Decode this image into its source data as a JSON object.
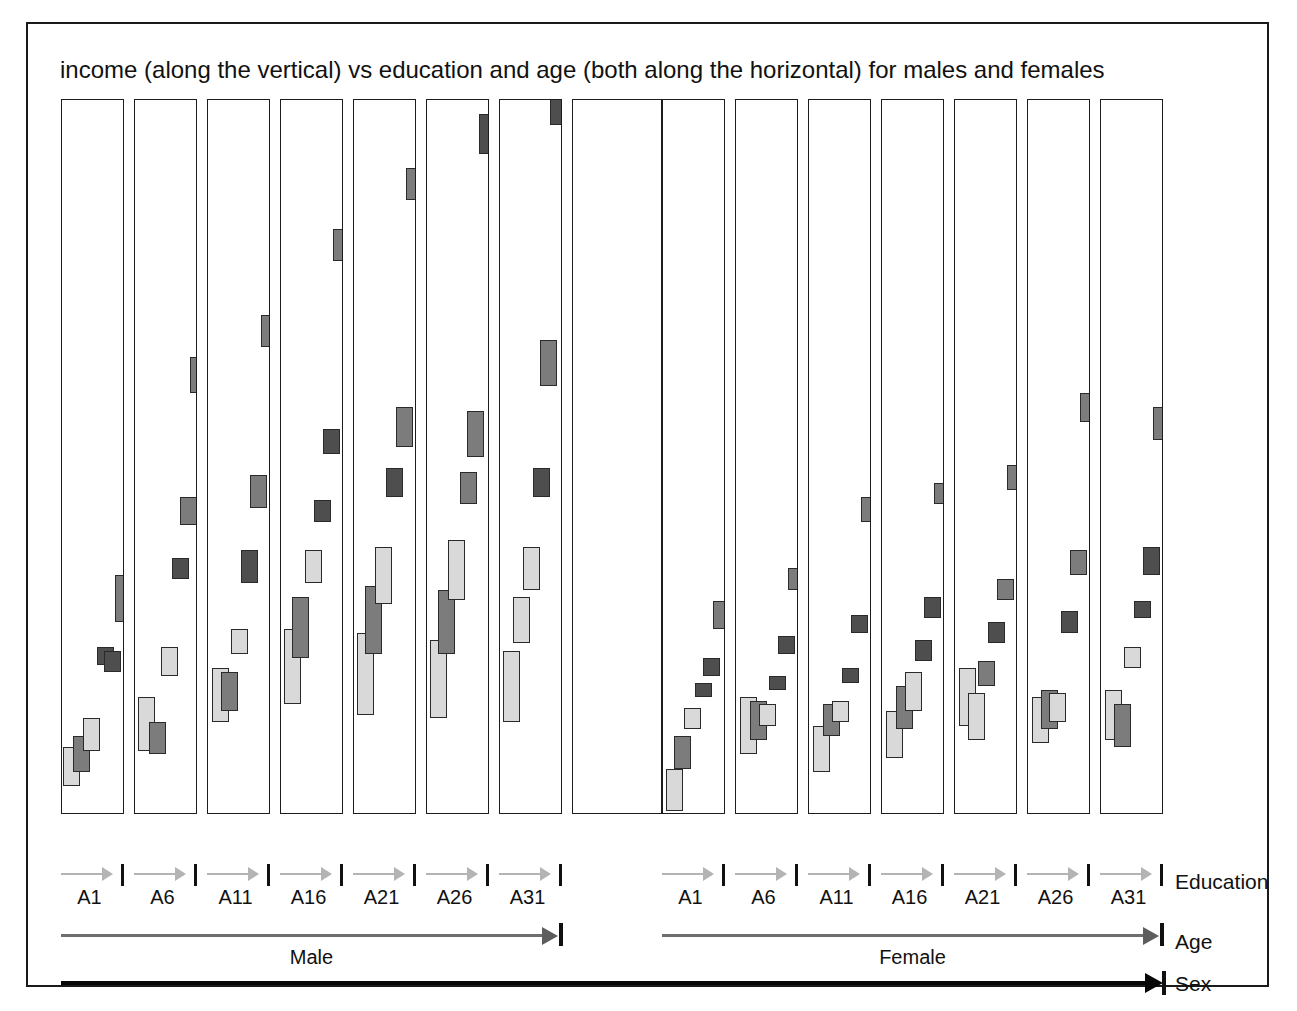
{
  "figure": {
    "title": "income (along the vertical) vs education and age (both along the horizontal) for males and females",
    "axis_names": {
      "education": "Education",
      "age": "Age",
      "sex": "Sex"
    },
    "sex_levels": [
      "Male",
      "Female"
    ],
    "age_levels": [
      "A1",
      "A6",
      "A11",
      "A16",
      "A21",
      "A26",
      "A31"
    ],
    "colors": {
      "light_mark": "#d9d9d9",
      "dark_mark": "#7c7c7c",
      "darker_mark": "#4e4e4e",
      "mark_outline": "#2a2a2a",
      "panel_border": "#1c1c1c",
      "education_arrow": "#b4b4b4",
      "age_arrow": "#6e6e6e",
      "sex_arrow": "#070707",
      "figure_border": "#1a1a1a",
      "background": "#ffffff"
    }
  },
  "chart_data": {
    "type": "bar",
    "title": "income (along the vertical) vs education and age (both along the horizontal) for males and females",
    "xlabel": "education and age (both along the horizontal)",
    "ylabel": "income (along the vertical)",
    "grid": false,
    "legend_position": "none",
    "nesting": [
      "Sex",
      "Age",
      "Education"
    ],
    "categories": [
      "A1",
      "A6",
      "A11",
      "A16",
      "A21",
      "A26",
      "A31"
    ],
    "ylim": [
      0,
      100
    ],
    "panels": [
      {
        "sex": "Male",
        "age": "A1",
        "panel_index": 0,
        "marks": [
          {
            "education": 1,
            "x_frac": 0.02,
            "value_low": 4.0,
            "value_high": 9.5,
            "shade": "light"
          },
          {
            "education": 2,
            "x_frac": 0.18,
            "value_low": 6.0,
            "value_high": 11.0,
            "shade": "dark"
          },
          {
            "education": 3,
            "x_frac": 0.34,
            "value_low": 9.0,
            "value_high": 13.5,
            "shade": "light"
          },
          {
            "education": 4,
            "x_frac": 0.56,
            "value_low": 21.0,
            "value_high": 23.5,
            "shade": "darker"
          },
          {
            "education": 5,
            "x_frac": 0.66,
            "value_low": 20.0,
            "value_high": 23.0,
            "shade": "darker"
          },
          {
            "education": 6,
            "x_frac": 0.84,
            "value_low": 27.0,
            "value_high": 33.5,
            "shade": "dark"
          }
        ]
      },
      {
        "sex": "Male",
        "age": "A6",
        "panel_index": 1,
        "marks": [
          {
            "education": 1,
            "x_frac": 0.05,
            "value_low": 9.0,
            "value_high": 16.5,
            "shade": "light"
          },
          {
            "education": 2,
            "x_frac": 0.22,
            "value_low": 8.5,
            "value_high": 13.0,
            "shade": "dark"
          },
          {
            "education": 3,
            "x_frac": 0.42,
            "value_low": 19.5,
            "value_high": 23.5,
            "shade": "light"
          },
          {
            "education": 4,
            "x_frac": 0.58,
            "value_low": 33.0,
            "value_high": 36.0,
            "shade": "darker"
          },
          {
            "education": 5,
            "x_frac": 0.72,
            "value_low": 40.5,
            "value_high": 44.5,
            "shade": "dark"
          },
          {
            "education": 6,
            "x_frac": 0.88,
            "value_low": 59.0,
            "value_high": 64.0,
            "shade": "dark"
          }
        ]
      },
      {
        "sex": "Male",
        "age": "A11",
        "panel_index": 2,
        "marks": [
          {
            "education": 1,
            "x_frac": 0.06,
            "value_low": 13.0,
            "value_high": 20.5,
            "shade": "light"
          },
          {
            "education": 2,
            "x_frac": 0.2,
            "value_low": 14.5,
            "value_high": 20.0,
            "shade": "dark"
          },
          {
            "education": 3,
            "x_frac": 0.36,
            "value_low": 22.5,
            "value_high": 26.0,
            "shade": "light"
          },
          {
            "education": 4,
            "x_frac": 0.52,
            "value_low": 32.5,
            "value_high": 37.0,
            "shade": "darker"
          },
          {
            "education": 5,
            "x_frac": 0.66,
            "value_low": 43.0,
            "value_high": 47.5,
            "shade": "dark"
          },
          {
            "education": 6,
            "x_frac": 0.84,
            "value_low": 65.5,
            "value_high": 70.0,
            "shade": "dark"
          }
        ]
      },
      {
        "sex": "Male",
        "age": "A16",
        "panel_index": 3,
        "marks": [
          {
            "education": 1,
            "x_frac": 0.04,
            "value_low": 15.5,
            "value_high": 26.0,
            "shade": "light"
          },
          {
            "education": 2,
            "x_frac": 0.18,
            "value_low": 22.0,
            "value_high": 30.5,
            "shade": "dark"
          },
          {
            "education": 3,
            "x_frac": 0.38,
            "value_low": 32.5,
            "value_high": 37.0,
            "shade": "light"
          },
          {
            "education": 4,
            "x_frac": 0.52,
            "value_low": 41.0,
            "value_high": 44.0,
            "shade": "darker"
          },
          {
            "education": 5,
            "x_frac": 0.66,
            "value_low": 50.5,
            "value_high": 54.0,
            "shade": "darker"
          },
          {
            "education": 6,
            "x_frac": 0.82,
            "value_low": 77.5,
            "value_high": 82.0,
            "shade": "dark"
          }
        ]
      },
      {
        "sex": "Male",
        "age": "A21",
        "panel_index": 4,
        "marks": [
          {
            "education": 1,
            "x_frac": 0.04,
            "value_low": 14.0,
            "value_high": 25.5,
            "shade": "light"
          },
          {
            "education": 2,
            "x_frac": 0.18,
            "value_low": 22.5,
            "value_high": 32.0,
            "shade": "dark"
          },
          {
            "education": 3,
            "x_frac": 0.34,
            "value_low": 29.5,
            "value_high": 37.5,
            "shade": "light"
          },
          {
            "education": 4,
            "x_frac": 0.5,
            "value_low": 44.5,
            "value_high": 48.5,
            "shade": "darker"
          },
          {
            "education": 5,
            "x_frac": 0.66,
            "value_low": 51.5,
            "value_high": 57.0,
            "shade": "dark"
          },
          {
            "education": 6,
            "x_frac": 0.82,
            "value_low": 86.0,
            "value_high": 90.5,
            "shade": "dark"
          }
        ]
      },
      {
        "sex": "Male",
        "age": "A26",
        "panel_index": 5,
        "marks": [
          {
            "education": 1,
            "x_frac": 0.04,
            "value_low": 13.5,
            "value_high": 24.5,
            "shade": "light"
          },
          {
            "education": 2,
            "x_frac": 0.18,
            "value_low": 22.5,
            "value_high": 31.5,
            "shade": "dark"
          },
          {
            "education": 3,
            "x_frac": 0.34,
            "value_low": 30.0,
            "value_high": 38.5,
            "shade": "light"
          },
          {
            "education": 4,
            "x_frac": 0.52,
            "value_low": 43.5,
            "value_high": 48.0,
            "shade": "dark"
          },
          {
            "education": 5,
            "x_frac": 0.64,
            "value_low": 50.0,
            "value_high": 56.5,
            "shade": "dark"
          },
          {
            "education": 6,
            "x_frac": 0.82,
            "value_low": 92.5,
            "value_high": 98.0,
            "shade": "darker"
          }
        ]
      },
      {
        "sex": "Male",
        "age": "A31",
        "panel_index": 6,
        "marks": [
          {
            "education": 1,
            "x_frac": 0.04,
            "value_low": 13.0,
            "value_high": 23.0,
            "shade": "light"
          },
          {
            "education": 2,
            "x_frac": 0.2,
            "value_low": 24.0,
            "value_high": 30.5,
            "shade": "light"
          },
          {
            "education": 3,
            "x_frac": 0.36,
            "value_low": 31.5,
            "value_high": 37.5,
            "shade": "light"
          },
          {
            "education": 4,
            "x_frac": 0.52,
            "value_low": 44.5,
            "value_high": 48.5,
            "shade": "darker"
          },
          {
            "education": 5,
            "x_frac": 0.64,
            "value_low": 60.0,
            "value_high": 66.5,
            "shade": "dark"
          },
          {
            "education": 6,
            "x_frac": 0.8,
            "value_low": 96.5,
            "value_high": 101.0,
            "shade": "darker"
          }
        ]
      },
      {
        "sex": "Female",
        "age": "A1",
        "panel_index": 7,
        "marks": [
          {
            "education": 1,
            "x_frac": 0.04,
            "value_low": 0.5,
            "value_high": 6.5,
            "shade": "light"
          },
          {
            "education": 2,
            "x_frac": 0.18,
            "value_low": 6.5,
            "value_high": 11.0,
            "shade": "dark"
          },
          {
            "education": 3,
            "x_frac": 0.34,
            "value_low": 12.0,
            "value_high": 15.0,
            "shade": "light"
          },
          {
            "education": 4,
            "x_frac": 0.5,
            "value_low": 16.5,
            "value_high": 18.5,
            "shade": "darker"
          },
          {
            "education": 5,
            "x_frac": 0.64,
            "value_low": 19.5,
            "value_high": 22.0,
            "shade": "darker"
          },
          {
            "education": 6,
            "x_frac": 0.8,
            "value_low": 26.0,
            "value_high": 30.0,
            "shade": "dark"
          }
        ]
      },
      {
        "sex": "Female",
        "age": "A6",
        "panel_index": 8,
        "marks": [
          {
            "education": 1,
            "x_frac": 0.06,
            "value_low": 8.5,
            "value_high": 16.5,
            "shade": "light"
          },
          {
            "education": 2,
            "x_frac": 0.22,
            "value_low": 10.5,
            "value_high": 16.0,
            "shade": "dark"
          },
          {
            "education": 3,
            "x_frac": 0.36,
            "value_low": 12.5,
            "value_high": 15.5,
            "shade": "light"
          },
          {
            "education": 4,
            "x_frac": 0.52,
            "value_low": 17.5,
            "value_high": 19.5,
            "shade": "darker"
          },
          {
            "education": 5,
            "x_frac": 0.66,
            "value_low": 22.5,
            "value_high": 25.0,
            "shade": "darker"
          },
          {
            "education": 6,
            "x_frac": 0.82,
            "value_low": 31.5,
            "value_high": 34.5,
            "shade": "dark"
          }
        ]
      },
      {
        "sex": "Female",
        "age": "A11",
        "panel_index": 9,
        "marks": [
          {
            "education": 1,
            "x_frac": 0.06,
            "value_low": 6.0,
            "value_high": 12.5,
            "shade": "light"
          },
          {
            "education": 2,
            "x_frac": 0.22,
            "value_low": 11.0,
            "value_high": 15.5,
            "shade": "dark"
          },
          {
            "education": 3,
            "x_frac": 0.36,
            "value_low": 13.0,
            "value_high": 16.0,
            "shade": "light"
          },
          {
            "education": 4,
            "x_frac": 0.52,
            "value_low": 18.5,
            "value_high": 20.5,
            "shade": "darker"
          },
          {
            "education": 5,
            "x_frac": 0.66,
            "value_low": 25.5,
            "value_high": 28.0,
            "shade": "darker"
          },
          {
            "education": 6,
            "x_frac": 0.82,
            "value_low": 41.0,
            "value_high": 44.5,
            "shade": "dark"
          }
        ]
      },
      {
        "sex": "Female",
        "age": "A16",
        "panel_index": 10,
        "marks": [
          {
            "education": 1,
            "x_frac": 0.06,
            "value_low": 8.0,
            "value_high": 14.5,
            "shade": "light"
          },
          {
            "education": 2,
            "x_frac": 0.22,
            "value_low": 12.0,
            "value_high": 18.0,
            "shade": "dark"
          },
          {
            "education": 3,
            "x_frac": 0.36,
            "value_low": 14.5,
            "value_high": 20.0,
            "shade": "light"
          },
          {
            "education": 4,
            "x_frac": 0.52,
            "value_low": 21.5,
            "value_high": 24.5,
            "shade": "darker"
          },
          {
            "education": 5,
            "x_frac": 0.66,
            "value_low": 27.5,
            "value_high": 30.5,
            "shade": "darker"
          },
          {
            "education": 6,
            "x_frac": 0.82,
            "value_low": 43.5,
            "value_high": 46.5,
            "shade": "dark"
          }
        ]
      },
      {
        "sex": "Female",
        "age": "A21",
        "panel_index": 11,
        "marks": [
          {
            "education": 1,
            "x_frac": 0.06,
            "value_low": 12.5,
            "value_high": 20.5,
            "shade": "light"
          },
          {
            "education": 2,
            "x_frac": 0.2,
            "value_low": 10.5,
            "value_high": 17.0,
            "shade": "light"
          },
          {
            "education": 3,
            "x_frac": 0.36,
            "value_low": 18.0,
            "value_high": 21.5,
            "shade": "dark"
          },
          {
            "education": 4,
            "x_frac": 0.52,
            "value_low": 24.0,
            "value_high": 27.0,
            "shade": "darker"
          },
          {
            "education": 5,
            "x_frac": 0.66,
            "value_low": 30.0,
            "value_high": 33.0,
            "shade": "dark"
          },
          {
            "education": 6,
            "x_frac": 0.82,
            "value_low": 45.5,
            "value_high": 49.0,
            "shade": "dark"
          }
        ]
      },
      {
        "sex": "Female",
        "age": "A26",
        "panel_index": 12,
        "marks": [
          {
            "education": 1,
            "x_frac": 0.06,
            "value_low": 10.0,
            "value_high": 16.5,
            "shade": "light"
          },
          {
            "education": 2,
            "x_frac": 0.2,
            "value_low": 12.0,
            "value_high": 17.5,
            "shade": "dark"
          },
          {
            "education": 3,
            "x_frac": 0.34,
            "value_low": 13.0,
            "value_high": 17.0,
            "shade": "light"
          },
          {
            "education": 4,
            "x_frac": 0.52,
            "value_low": 25.5,
            "value_high": 28.5,
            "shade": "darker"
          },
          {
            "education": 5,
            "x_frac": 0.66,
            "value_low": 33.5,
            "value_high": 37.0,
            "shade": "dark"
          },
          {
            "education": 6,
            "x_frac": 0.82,
            "value_low": 55.0,
            "value_high": 59.0,
            "shade": "dark"
          }
        ]
      },
      {
        "sex": "Female",
        "age": "A31",
        "panel_index": 13,
        "marks": [
          {
            "education": 1,
            "x_frac": 0.06,
            "value_low": 10.5,
            "value_high": 17.5,
            "shade": "light"
          },
          {
            "education": 2,
            "x_frac": 0.2,
            "value_low": 9.5,
            "value_high": 15.5,
            "shade": "dark"
          },
          {
            "education": 3,
            "x_frac": 0.36,
            "value_low": 20.5,
            "value_high": 23.5,
            "shade": "light"
          },
          {
            "education": 4,
            "x_frac": 0.52,
            "value_low": 27.5,
            "value_high": 30.0,
            "shade": "darker"
          },
          {
            "education": 5,
            "x_frac": 0.66,
            "value_low": 33.5,
            "value_high": 37.5,
            "shade": "darker"
          },
          {
            "education": 6,
            "x_frac": 0.82,
            "value_low": 52.5,
            "value_high": 57.0,
            "shade": "dark"
          }
        ]
      }
    ]
  }
}
